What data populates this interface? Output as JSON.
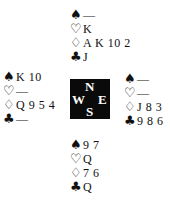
{
  "suit_symbols": {
    "spades": "♠",
    "hearts": "♡",
    "diamonds": "♢",
    "clubs": "♣"
  },
  "hands": {
    "north": {
      "spades": "—",
      "hearts": "K",
      "diamonds": "A K 10 2",
      "clubs": "J"
    },
    "west": {
      "spades": "K 10",
      "hearts": "—",
      "diamonds": "Q 9 5 4",
      "clubs": "—"
    },
    "east": {
      "spades": "—",
      "hearts": "—",
      "diamonds": "J 8 3",
      "clubs": "9 8 6"
    },
    "south": {
      "spades": "9 7",
      "hearts": "Q",
      "diamonds": "7 6",
      "clubs": "Q"
    }
  },
  "compass": {
    "north": "N",
    "south": "S",
    "west": "W",
    "east": "E"
  }
}
